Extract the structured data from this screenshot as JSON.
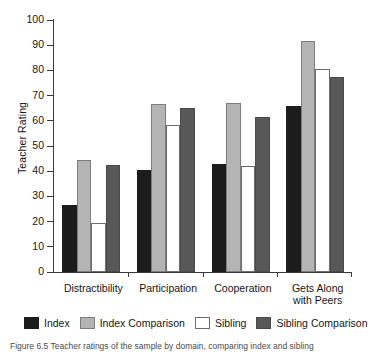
{
  "figure": {
    "caption": "Figure 6.5  Teacher ratings of the sample by domain, comparing index and sibling"
  },
  "chart_data": {
    "type": "bar",
    "title": "",
    "xlabel": "",
    "ylabel": "Teacher Rating",
    "ylim": [
      0,
      100
    ],
    "ytick_step": 10,
    "yticks": [
      "100",
      "90",
      "80",
      "70",
      "60",
      "50",
      "40",
      "30",
      "20",
      "10",
      "0"
    ],
    "grid": false,
    "legend_position": "bottom",
    "categories": [
      "Distractibility",
      "Participation",
      "Cooperation",
      "Gets Along with Peers"
    ],
    "series": [
      {
        "name": "Index",
        "color": "#1c1c1c",
        "values": [
          26.5,
          40.5,
          43.0,
          66.0
        ]
      },
      {
        "name": "Index Comparison",
        "color": "#b4b4b4",
        "values": [
          44.5,
          66.5,
          67.0,
          91.5
        ]
      },
      {
        "name": "Sibling",
        "color": "#ffffff",
        "values": [
          19.5,
          58.5,
          42.0,
          80.5
        ]
      },
      {
        "name": "Sibling Comparison",
        "color": "#585858",
        "values": [
          42.5,
          65.0,
          61.5,
          77.5
        ]
      }
    ]
  },
  "legend": {
    "items": [
      {
        "label": "Index"
      },
      {
        "label": "Index Comparison"
      },
      {
        "label": "Sibling"
      },
      {
        "label": "Sibling Comparison"
      }
    ]
  }
}
